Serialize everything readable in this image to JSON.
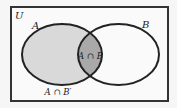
{
  "diagram": {
    "type": "venn",
    "universe_label": "U",
    "sets": [
      {
        "name": "A",
        "label": "A"
      },
      {
        "name": "B",
        "label": "B"
      }
    ],
    "regions": {
      "intersection_label": "A ∩ B",
      "a_only_label": "A ∩ B′"
    },
    "colors": {
      "background": "#f6f6f6",
      "universe_fill": "#fafafa",
      "a_only_fill": "#d9d9d9",
      "intersection_fill": "#a9a9a9",
      "stroke": "#222222"
    }
  }
}
